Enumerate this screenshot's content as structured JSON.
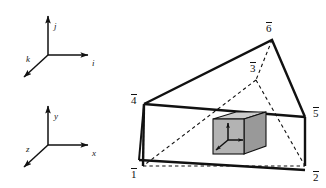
{
  "figure": {
    "background_color": "#ffffff",
    "stroke_color": "#111111",
    "cube_face_front_color": "#b3b3b3",
    "cube_face_top_color": "#cccccc",
    "cube_face_right_color": "#999999"
  },
  "frames": [
    {
      "name": "material-frame",
      "axes": [
        {
          "label": "i",
          "direction": "right"
        },
        {
          "label": "j",
          "direction": "up"
        },
        {
          "label": "k",
          "direction": "down-left"
        }
      ]
    },
    {
      "name": "spatial-frame",
      "axes": [
        {
          "label": "x",
          "direction": "right"
        },
        {
          "label": "y",
          "direction": "up"
        },
        {
          "label": "z",
          "direction": "down-left"
        }
      ]
    }
  ],
  "prism": {
    "name": "triangular-prism-body",
    "vertices": [
      {
        "id": "v1",
        "label": "1",
        "barred": true
      },
      {
        "id": "v2",
        "label": "2",
        "barred": true
      },
      {
        "id": "v3",
        "label": "3",
        "barred": true
      },
      {
        "id": "v4",
        "label": "4",
        "barred": true
      },
      {
        "id": "v5",
        "label": "5",
        "barred": true
      },
      {
        "id": "v6",
        "label": "6",
        "barred": true
      }
    ],
    "hidden_edges_style": "dashed",
    "visible_edges_style": "solid"
  },
  "element_cube": {
    "name": "shaded-cube-element",
    "triad_axes": [
      {
        "label": "",
        "direction": "up"
      },
      {
        "label": "",
        "direction": "right"
      },
      {
        "label": "",
        "direction": "down-left"
      }
    ]
  }
}
